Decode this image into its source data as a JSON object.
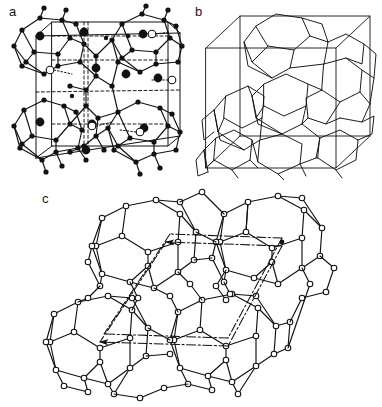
{
  "figure": {
    "type": "scientific-figure",
    "background_color": "#ffffff",
    "line_color": "#111111",
    "width": 382,
    "height": 407
  },
  "panels": [
    {
      "id": "a",
      "label": "a",
      "label_position": "top-left",
      "render_style": "ball-and-stick",
      "description": "Clathrate framework projected along an axis showing polyhedral cages built from small filled atoms, with large filled circles and open circles marking two distinct guest atom sites inside the cages; unit cell outlined with solid lines and internal dashed construction lines.",
      "markers": [
        {
          "name": "framework-atom",
          "style": "small filled circle",
          "fill": "#111111",
          "radius_px": 2.4
        },
        {
          "name": "guest-atom-filled",
          "style": "large filled circle",
          "fill": "#111111",
          "radius_px": 4.2
        },
        {
          "name": "guest-atom-open",
          "style": "open circle",
          "fill": "#ffffff",
          "stroke": "#111111",
          "radius_px": 3.6
        }
      ],
      "cell_lines": [
        {
          "name": "unit-cell-edge",
          "style": "solid"
        },
        {
          "name": "unit-cell-internal",
          "style": "dashed"
        },
        {
          "name": "guest-leader",
          "style": "dotted"
        }
      ]
    },
    {
      "id": "b",
      "label": "b",
      "label_position": "top-left",
      "render_style": "wireframe-polyhedra",
      "description": "Space-filling arrangement of face-sharing polyhedral cages (pentagonal dodecahedra and larger tetrakaidecahedra) drawn as open wireframe polygons, enclosed by a cubic unit cell drawn in oblique perspective.",
      "markers": [],
      "cell_lines": [
        {
          "name": "unit-cell-edge",
          "style": "solid"
        }
      ]
    },
    {
      "id": "c",
      "label": "c",
      "label_position": "top-left",
      "render_style": "ball-and-stick",
      "description": "Cluster of four large fused polyhedral cages with open-circle atom vertices, overlaid with dash-dot crystallographic axis lines terminating in arrowheads that indicate the unit cell vectors.",
      "markers": [
        {
          "name": "framework-atom-open",
          "style": "open circle",
          "fill": "#ffffff",
          "stroke": "#111111",
          "radius_px": 2.6
        }
      ],
      "cell_lines": [
        {
          "name": "axis-vector",
          "style": "dash-dot",
          "has_arrowhead": true
        }
      ]
    }
  ]
}
